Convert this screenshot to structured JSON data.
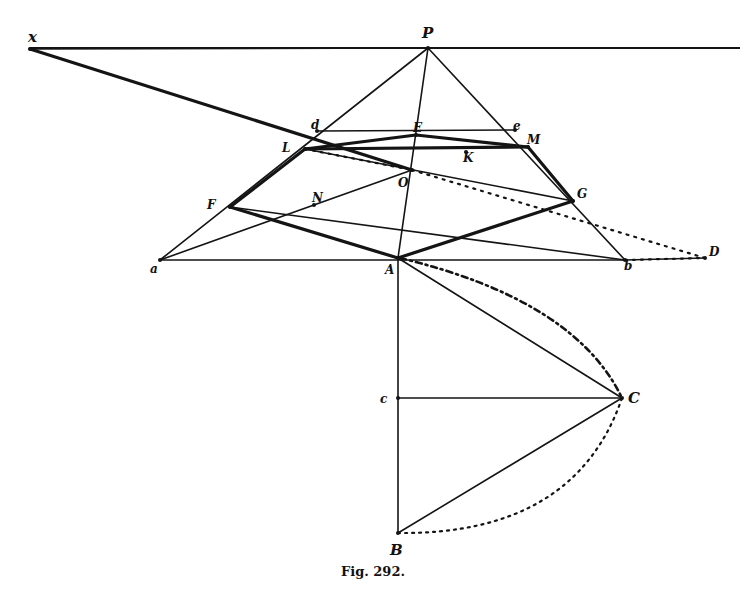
{
  "figure": {
    "caption": "Fig. 292.",
    "ink_color": "#141414",
    "background": "#ffffff"
  },
  "points": {
    "x": {
      "label": "x",
      "pos": [
        30,
        49
      ],
      "label_pos": [
        28,
        42
      ]
    },
    "P": {
      "label": "P",
      "pos": [
        428,
        48
      ],
      "label_pos": [
        422,
        38
      ]
    },
    "a": {
      "label": "a",
      "pos": [
        160,
        260
      ],
      "label_pos": [
        150,
        273
      ]
    },
    "b": {
      "label": "b",
      "pos": [
        625,
        260
      ],
      "label_pos": [
        624,
        270
      ]
    },
    "D": {
      "label": "D",
      "pos": [
        705,
        258
      ],
      "label_pos": [
        709,
        256
      ]
    },
    "A": {
      "label": "A",
      "pos": [
        398,
        258
      ],
      "label_pos": [
        385,
        274
      ]
    },
    "d": {
      "label": "d",
      "pos": [
        317,
        131
      ],
      "label_pos": [
        311,
        129
      ]
    },
    "e": {
      "label": "e",
      "pos": [
        515,
        130
      ],
      "label_pos": [
        513,
        130
      ]
    },
    "L": {
      "label": "L",
      "pos": [
        305,
        149
      ],
      "label_pos": [
        282,
        152
      ]
    },
    "M": {
      "label": "M",
      "pos": [
        528,
        147
      ],
      "label_pos": [
        527,
        144
      ]
    },
    "E": {
      "label": "E",
      "pos": [
        416,
        135
      ],
      "label_pos": [
        413,
        132
      ]
    },
    "K": {
      "label": "K",
      "pos": [
        466,
        152
      ],
      "label_pos": [
        463,
        162
      ]
    },
    "O": {
      "label": "O",
      "pos": [
        412,
        170
      ],
      "label_pos": [
        398,
        187
      ]
    },
    "F": {
      "label": "F",
      "pos": [
        230,
        207
      ],
      "label_pos": [
        207,
        209
      ]
    },
    "G": {
      "label": "G",
      "pos": [
        573,
        201
      ],
      "label_pos": [
        577,
        198
      ]
    },
    "N": {
      "label": "N",
      "pos": [
        314,
        205
      ],
      "label_pos": [
        312,
        202
      ]
    },
    "c": {
      "label": "c",
      "pos": [
        398,
        398
      ],
      "label_pos": [
        380,
        403
      ]
    },
    "C": {
      "label": "C",
      "pos": [
        622,
        398
      ],
      "label_pos": [
        628,
        403
      ]
    },
    "B": {
      "label": "B",
      "pos": [
        398,
        533
      ],
      "label_pos": [
        390,
        555
      ]
    }
  },
  "segments": {
    "thin": [
      [
        "x",
        "P"
      ],
      [
        "a",
        "P"
      ],
      [
        "P",
        "b"
      ],
      [
        "P",
        "A"
      ],
      [
        "a",
        "b"
      ],
      [
        "A",
        "B"
      ],
      [
        "c",
        "C"
      ],
      [
        "A",
        "C"
      ],
      [
        "B",
        "C"
      ],
      [
        "a",
        "O"
      ],
      [
        "F",
        "b"
      ],
      [
        "b",
        "D"
      ],
      [
        "L",
        "G"
      ],
      [
        "d",
        "e"
      ]
    ],
    "thick": [
      [
        "x",
        "O"
      ],
      [
        "L",
        "E"
      ],
      [
        "E",
        "M"
      ],
      [
        "L",
        "F"
      ],
      [
        "F",
        "A"
      ],
      [
        "A",
        "G"
      ],
      [
        "G",
        "M"
      ],
      [
        "L",
        "M"
      ]
    ],
    "dotted": [
      [
        "L",
        "O"
      ],
      [
        "O",
        "D"
      ],
      [
        "b",
        "D"
      ]
    ]
  },
  "horizon": {
    "from": [
      30,
      48
    ],
    "to": [
      740,
      48
    ]
  },
  "arcs": {
    "upper": {
      "from": "A",
      "to": "C",
      "style": "dash-dot"
    },
    "lower": {
      "from": "B",
      "to": "C",
      "style": "dotted"
    }
  }
}
